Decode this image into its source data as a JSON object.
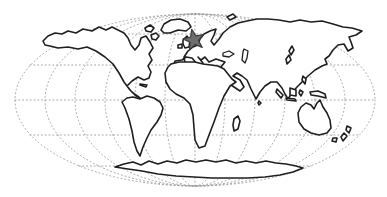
{
  "map": {
    "type": "world-map-outline",
    "projection": "oval-mollweide-style",
    "colors": {
      "background": "#ffffff",
      "coastline": "#1f1f1f",
      "land_fill": "#ffffff",
      "graticule": "#9a9a9a",
      "marker_fill": "#6e6e6e",
      "marker_stroke": "#3a3a3a"
    },
    "graticule": {
      "style": "dotted",
      "parallels_deg": [
        -60,
        -30,
        0,
        30,
        60
      ],
      "meridians_deg": [
        -150,
        -120,
        -90,
        -60,
        -30,
        0,
        30,
        60,
        90,
        120,
        150
      ]
    },
    "marker": {
      "shape": "star",
      "region": "northwestern-europe",
      "transform": "translate(194,40) rotate(-12)"
    }
  }
}
